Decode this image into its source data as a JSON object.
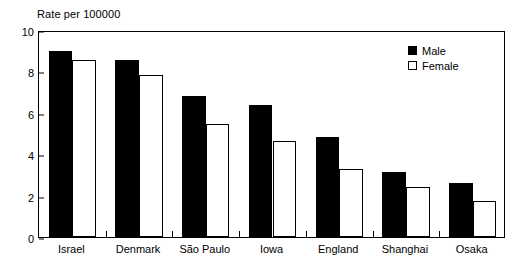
{
  "chart_data": {
    "type": "bar",
    "title": "Rate per 100000",
    "xlabel": "",
    "ylabel": "Rate per 100000",
    "ylim": [
      0,
      10
    ],
    "yticks": [
      0,
      2,
      4,
      6,
      8,
      10
    ],
    "grid": false,
    "legend_position": "top-right",
    "categories": [
      "Israel",
      "Denmark",
      "São Paulo",
      "Iowa",
      "England",
      "Shanghai",
      "Osaka"
    ],
    "series": [
      {
        "name": "Male",
        "color": "#000000",
        "values": [
          9.0,
          8.55,
          6.8,
          6.4,
          4.85,
          3.15,
          2.6
        ]
      },
      {
        "name": "Female",
        "color": "#ffffff",
        "values": [
          8.55,
          7.85,
          5.45,
          4.65,
          3.3,
          2.4,
          1.75
        ]
      }
    ]
  },
  "axis": {
    "title": "Rate per 100000",
    "y_tick_labels": [
      "0",
      "2",
      "4",
      "6",
      "8",
      "10"
    ],
    "x_tick_labels": [
      "Israel",
      "Denmark",
      "São Paulo",
      "Iowa",
      "England",
      "Shanghai",
      "Osaka"
    ]
  },
  "legend": {
    "items": [
      {
        "label": "Male",
        "swatch": "filled-black-square"
      },
      {
        "label": "Female",
        "swatch": "outlined-white-square"
      }
    ]
  }
}
